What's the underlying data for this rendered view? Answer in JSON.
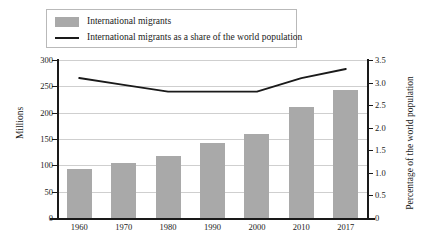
{
  "legend": {
    "items": [
      {
        "label": "International migrants",
        "marker": "bar-swatch",
        "color": "#a9a9a9"
      },
      {
        "label": "International migrants as a share of the world population",
        "marker": "line-swatch",
        "color": "#1a1a1a"
      }
    ]
  },
  "chart_data": {
    "type": "bar",
    "title": "",
    "xlabel": "",
    "ylabel": "Millions",
    "y2label": "Percentage of the world population",
    "categories": [
      "1960",
      "1970",
      "1980",
      "1990",
      "2000",
      "2010",
      "2017"
    ],
    "ylim": [
      0,
      300
    ],
    "y2lim": [
      0,
      3.5
    ],
    "yticks": [
      "0",
      "50",
      "100",
      "150",
      "200",
      "250",
      "300"
    ],
    "ytick_values": [
      0,
      50,
      100,
      150,
      200,
      250,
      300
    ],
    "y2ticks": [
      "0",
      "0.5",
      "1.0",
      "1.5",
      "2.0",
      "2.5",
      "3.0",
      "3.5"
    ],
    "y2tick_values": [
      0,
      0.5,
      1.0,
      1.5,
      2.0,
      2.5,
      3.0,
      3.5
    ],
    "grid": true,
    "legend_position": "top-left",
    "series": [
      {
        "name": "International migrants",
        "type": "bar",
        "axis": "left",
        "unit": "millions",
        "color": "#a9a9a9",
        "values": [
          93,
          105,
          118,
          142,
          160,
          210,
          244
        ]
      },
      {
        "name": "International migrants as a share of the world population",
        "type": "line",
        "axis": "right",
        "unit": "percent",
        "color": "#1a1a1a",
        "values": [
          3.1,
          2.95,
          2.8,
          2.8,
          2.8,
          3.1,
          3.3
        ]
      }
    ]
  }
}
